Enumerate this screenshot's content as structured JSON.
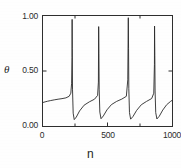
{
  "chart_data": {
    "type": "line",
    "title": "",
    "subtitle": "",
    "xlabel": "n",
    "ylabel": "θ",
    "xlim": [
      0,
      1000
    ],
    "ylim": [
      0.0,
      1.0
    ],
    "grid": false,
    "legend": null,
    "annotations": [],
    "xticks": [
      {
        "value": 0,
        "label": "0"
      },
      {
        "value": 500,
        "label": "500"
      },
      {
        "value": 1000,
        "label": "1000"
      }
    ],
    "xminorticks": [
      250,
      750
    ],
    "yticks": [
      {
        "value": 0.0,
        "label": "0.00"
      },
      {
        "value": 0.5,
        "label": "0.50"
      },
      {
        "value": 1.0,
        "label": "1.00"
      }
    ],
    "series": [
      {
        "name": "theta(n)",
        "color": "#2a2a2a",
        "linewidth": 0.9,
        "laminar_baseline_start": 0.22,
        "laminar_baseline_end": 0.26,
        "burst_peak": 0.97,
        "burst_reinjection": 0.06,
        "burst_positions": [
          228,
          432,
          660,
          862
        ],
        "x": [
          0,
          20,
          40,
          60,
          90,
          120,
          150,
          180,
          205,
          218,
          224,
          227,
          228,
          229,
          231,
          236,
          244,
          260,
          285,
          320,
          360,
          400,
          424,
          430,
          432,
          434,
          436,
          441,
          450,
          468,
          496,
          530,
          570,
          610,
          645,
          656,
          660,
          662,
          664,
          669,
          678,
          696,
          724,
          760,
          800,
          840,
          856,
          861,
          862,
          864,
          866,
          871,
          880,
          898,
          925,
          955,
          985,
          1000
        ],
        "y": [
          0.215,
          0.222,
          0.228,
          0.233,
          0.24,
          0.246,
          0.251,
          0.258,
          0.272,
          0.3,
          0.39,
          0.62,
          0.965,
          0.7,
          0.33,
          0.12,
          0.062,
          0.085,
          0.14,
          0.192,
          0.222,
          0.246,
          0.28,
          0.4,
          0.9,
          0.66,
          0.33,
          0.13,
          0.07,
          0.095,
          0.15,
          0.197,
          0.226,
          0.247,
          0.272,
          0.42,
          0.98,
          0.7,
          0.34,
          0.125,
          0.066,
          0.09,
          0.145,
          0.196,
          0.226,
          0.252,
          0.3,
          0.56,
          0.905,
          0.64,
          0.32,
          0.125,
          0.068,
          0.092,
          0.148,
          0.196,
          0.226,
          0.238
        ]
      }
    ]
  },
  "axes": {
    "frame": {
      "color": "#2e2e2e"
    },
    "tick_direction": "in"
  },
  "icons": {}
}
